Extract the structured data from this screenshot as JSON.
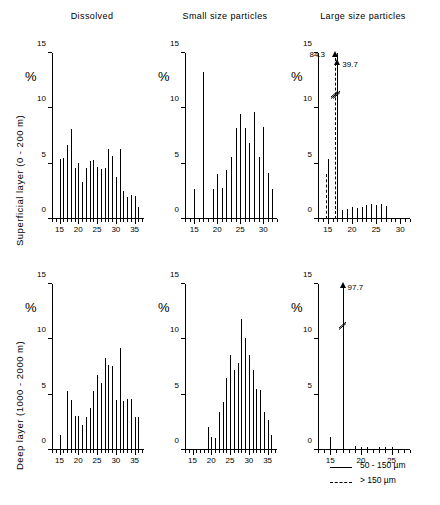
{
  "figure": {
    "column_titles": [
      "Dissolved",
      "Small size particles",
      "Large size particles"
    ],
    "row_labels": [
      "Superficial layer  (0 - 200 m)",
      "Deep  layer  (1000 - 2000 m)"
    ],
    "y_axis_unit": "%",
    "y_ticks": [
      "0",
      "5",
      "10",
      "15"
    ],
    "legend": [
      {
        "style": "solid",
        "label": "50 - 150 µm"
      },
      {
        "style": "dashed",
        "label": "> 150 µm"
      }
    ]
  },
  "chart_data": [
    {
      "type": "bar",
      "title": "Dissolved",
      "row": "Superficial layer (0 - 200 m)",
      "xlabel": "",
      "ylabel": "%",
      "ylim": [
        0,
        15
      ],
      "xlim": [
        13,
        37.5
      ],
      "xticks": [
        15,
        20,
        25,
        30,
        35
      ],
      "grid": false,
      "x": [
        15,
        16,
        17,
        18,
        19,
        20,
        21,
        22,
        23,
        24,
        25,
        26,
        27,
        28,
        29,
        30,
        31,
        32,
        33,
        34,
        35,
        36
      ],
      "values": [
        5.4,
        5.5,
        6.7,
        8.1,
        4.6,
        5.1,
        3.3,
        4.6,
        5.2,
        5.3,
        4.7,
        4.5,
        4.6,
        6.3,
        5.7,
        3.8,
        6.3,
        2.5,
        2.0,
        2.2,
        2.1,
        1.1
      ]
    },
    {
      "type": "bar",
      "title": "Small size particles",
      "row": "Superficial layer (0 - 200 m)",
      "xlabel": "",
      "ylabel": "%",
      "ylim": [
        0,
        15
      ],
      "xlim": [
        13,
        33
      ],
      "xticks": [
        15,
        20,
        25,
        30
      ],
      "grid": false,
      "x": [
        15,
        17,
        19,
        20,
        21,
        22,
        23,
        24,
        25,
        26,
        27,
        28,
        29,
        30,
        31,
        32
      ],
      "values": [
        2.7,
        13.3,
        2.7,
        4.1,
        2.8,
        4.4,
        5.6,
        8.2,
        9.5,
        8.2,
        6.9,
        9.7,
        5.6,
        8.3,
        4.2,
        2.7
      ]
    },
    {
      "type": "bar",
      "title": "Large size particles",
      "row": "Superficial layer (0 - 200 m)",
      "xlabel": "",
      "ylabel": "%",
      "ylim": [
        0,
        15
      ],
      "xlim": [
        13,
        32
      ],
      "xticks": [
        15,
        20,
        25,
        30
      ],
      "grid": false,
      "series": [
        {
          "name": "50 - 150 µm",
          "style": "solid",
          "x": [
            15,
            17,
            18,
            19,
            20,
            21,
            22,
            23,
            24,
            25,
            26,
            27
          ],
          "values": [
            5.4,
            15,
            0.8,
            0.9,
            1.1,
            1.0,
            1.1,
            1.3,
            1.4,
            1.3,
            1.4,
            1.2
          ],
          "clipped": [
            {
              "x": 17,
              "true_value": 39.7
            }
          ]
        },
        {
          "name": "> 150 µm",
          "style": "dashed",
          "x": [
            14.6,
            16.6
          ],
          "values": [
            4.1,
            15
          ],
          "clipped": [
            {
              "x": 16.6,
              "true_value": 84.3
            }
          ]
        }
      ],
      "annotations": [
        {
          "text": "84.3",
          "target_x": 16.6
        },
        {
          "text": "39.7",
          "target_x": 17
        }
      ]
    },
    {
      "type": "bar",
      "title": "Dissolved",
      "row": "Deep layer (1000 - 2000 m)",
      "xlabel": "",
      "ylabel": "%",
      "ylim": [
        0,
        15
      ],
      "xlim": [
        13,
        37.5
      ],
      "xticks": [
        15,
        20,
        25,
        30,
        35
      ],
      "grid": false,
      "x": [
        15,
        17,
        18,
        19,
        20,
        21,
        22,
        23,
        24,
        25,
        26,
        27,
        28,
        29,
        30,
        31,
        32,
        33,
        34,
        35,
        36
      ],
      "values": [
        1.4,
        5.3,
        4.5,
        3.1,
        3.1,
        2.3,
        3.0,
        3.8,
        5.3,
        6.8,
        6.1,
        8.3,
        7.7,
        7.6,
        4.5,
        9.2,
        4.4,
        4.6,
        4.6,
        3.0,
        3.0
      ]
    },
    {
      "type": "bar",
      "title": "Small size particles",
      "row": "Deep layer (1000 - 2000 m)",
      "xlabel": "",
      "ylabel": "%",
      "ylim": [
        0,
        15
      ],
      "xlim": [
        13,
        37.5
      ],
      "xticks": [
        15,
        20,
        25,
        30,
        35
      ],
      "grid": false,
      "x": [
        19,
        20,
        21,
        22,
        23,
        24,
        25,
        26,
        27,
        28,
        29,
        30,
        31,
        32,
        33,
        34,
        35,
        36
      ],
      "values": [
        2.1,
        1.2,
        1.1,
        3.4,
        4.3,
        6.5,
        8.6,
        7.2,
        7.9,
        11.8,
        10.1,
        8.6,
        7.2,
        5.5,
        5.4,
        3.4,
        2.7,
        1.4
      ]
    },
    {
      "type": "bar",
      "title": "Large size particles",
      "row": "Deep layer (1000 - 2000 m)",
      "xlabel": "",
      "ylabel": "%",
      "ylim": [
        0,
        15
      ],
      "xlim": [
        13,
        28
      ],
      "xticks": [
        15,
        20,
        25
      ],
      "grid": false,
      "series": [
        {
          "name": "50 - 150 µm",
          "style": "solid",
          "x": [
            15,
            17,
            19,
            20,
            21,
            23,
            24,
            25
          ],
          "values": [
            1.2,
            15,
            0.35,
            0.25,
            0.3,
            0.3,
            0.3,
            0.3
          ],
          "clipped": [
            {
              "x": 17,
              "true_value": 97.7
            }
          ]
        }
      ],
      "annotations": [
        {
          "text": "97.7",
          "target_x": 17
        }
      ]
    }
  ]
}
